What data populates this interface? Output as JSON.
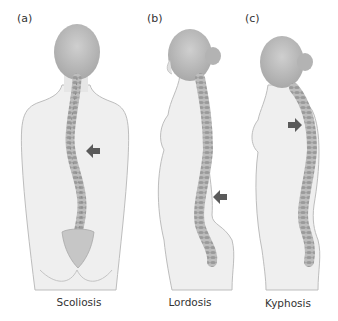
{
  "figure": {
    "panels": [
      {
        "id": "a",
        "label": "(a)",
        "caption": "Scoliosis",
        "view": "posterior",
        "arrow_direction": "left"
      },
      {
        "id": "b",
        "label": "(b)",
        "caption": "Lordosis",
        "view": "lateral",
        "arrow_direction": "left"
      },
      {
        "id": "c",
        "label": "(c)",
        "caption": "Kyphosis",
        "view": "lateral",
        "arrow_direction": "right"
      }
    ],
    "colors": {
      "skin": "#ededed",
      "outline": "#b8b8b8",
      "head_shade": "#bdbdbd",
      "spine": "#a9a9a9",
      "spine_dark": "#7d7d7d",
      "arrow": "#5a5a5a"
    }
  }
}
